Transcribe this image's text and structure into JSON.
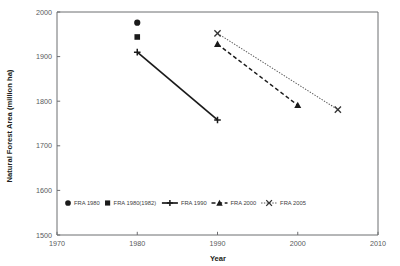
{
  "chart_data": {
    "type": "line",
    "title": "",
    "xlabel": "Year",
    "ylabel": "Natural Forest Area (million ha)",
    "xlim": [
      1970,
      2010
    ],
    "ylim": [
      1500,
      2000
    ],
    "xticks": [
      1970,
      1980,
      1990,
      2000,
      2010
    ],
    "xtick_labels": [
      "1970",
      "1980",
      "1990",
      "2000",
      "2010"
    ],
    "yticks": [
      1500,
      1600,
      1700,
      1800,
      1900,
      2000
    ],
    "ytick_labels": [
      "1500",
      "1600",
      "1700",
      "1800",
      "1900",
      "2000"
    ],
    "grid": false,
    "legend_position": "inside-bottom-left",
    "series": [
      {
        "name": "FRA 1980",
        "marker": "circle",
        "line": "none",
        "x": [
          1980
        ],
        "y": [
          1976
        ]
      },
      {
        "name": "FRA 1980(1982)",
        "marker": "square",
        "line": "none",
        "x": [
          1980
        ],
        "y": [
          1944
        ]
      },
      {
        "name": "FRA 1990",
        "marker": "plus",
        "line": "solid",
        "x": [
          1980,
          1990
        ],
        "y": [
          1910,
          1758
        ]
      },
      {
        "name": "FRA 2000",
        "marker": "triangle",
        "line": "dashed",
        "x": [
          1990,
          2000
        ],
        "y": [
          1928,
          1791
        ]
      },
      {
        "name": "FRA 2005",
        "marker": "x",
        "line": "dotted",
        "x": [
          1990,
          2005
        ],
        "y": [
          1952,
          1781
        ]
      }
    ]
  },
  "axes": {
    "x_title": "Year",
    "y_title": "Natural Forest Area (million ha)"
  },
  "legend": {
    "items": [
      {
        "label": "FRA 1980",
        "marker": "circle",
        "line": "none"
      },
      {
        "label": "FRA 1980(1982)",
        "marker": "square",
        "line": "none"
      },
      {
        "label": "FRA 1990",
        "marker": "plus",
        "line": "solid"
      },
      {
        "label": "FRA 2000",
        "marker": "triangle",
        "line": "dashed"
      },
      {
        "label": "FRA 2005",
        "marker": "x",
        "line": "dotted"
      }
    ]
  },
  "colors": {
    "ink": "#1a1a1a",
    "axis": "#6d6e71",
    "tick_text": "#58595b",
    "legend_text": "#414042",
    "background": "#ffffff"
  }
}
